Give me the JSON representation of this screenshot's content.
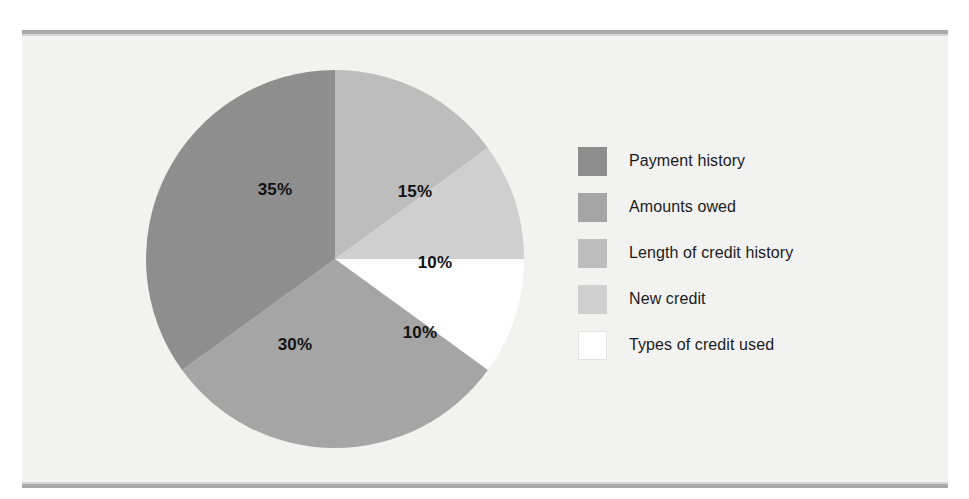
{
  "figure": {
    "background_color": "#f2f2f1",
    "rule_color": "#a8a8a8"
  },
  "legend": {
    "items": [
      {
        "label": "Payment history",
        "color": "#8e8e8e"
      },
      {
        "label": "Amounts owed",
        "color": "#a5a5a5"
      },
      {
        "label": "Length of credit history",
        "color": "#bdbdbd"
      },
      {
        "label": "New credit",
        "color": "#cfcfcf"
      },
      {
        "label": "Types of credit used",
        "color": "#ffffff"
      }
    ]
  },
  "chart_data": {
    "type": "pie",
    "title": "",
    "categories": [
      "Payment history",
      "Amounts owed",
      "Length of credit history",
      "New credit",
      "Types of credit used"
    ],
    "values": [
      35,
      30,
      15,
      10,
      10
    ],
    "value_unit": "%",
    "colors": [
      "#8e8e8e",
      "#a5a5a5",
      "#bdbdbd",
      "#cfcfcf",
      "#ffffff"
    ],
    "start_angle_deg": 0,
    "direction": "clockwise",
    "legend_position": "right",
    "grid": false,
    "slices": [
      {
        "label": "Amounts owed",
        "value": 15,
        "display": "15%",
        "color": "#bdbdbd",
        "label_x": 415,
        "label_y": 192
      },
      {
        "label": "Length of credit history",
        "value": 10,
        "display": "10%",
        "color": "#cfcfcf",
        "label_x": 435,
        "label_y": 263
      },
      {
        "label": "Types of credit used",
        "value": 10,
        "display": "10%",
        "color": "#ffffff",
        "label_x": 420,
        "label_y": 333
      },
      {
        "label": "New credit",
        "value": 30,
        "display": "30%",
        "color": "#a5a5a5",
        "label_x": 295,
        "label_y": 345
      },
      {
        "label": "Payment history",
        "value": 35,
        "display": "35%",
        "color": "#8e8e8e",
        "label_x": 275,
        "label_y": 190
      }
    ]
  }
}
